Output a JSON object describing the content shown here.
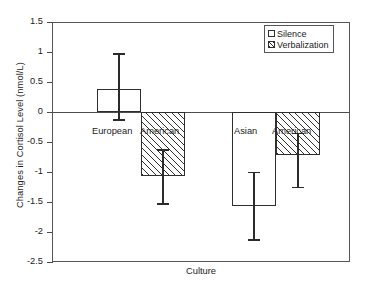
{
  "chart_data": {
    "type": "bar",
    "title": "",
    "xlabel": "Culture",
    "ylabel": "Changes in Cortisol Level  (nmol/L)",
    "categories": [
      "European American",
      "Asian American"
    ],
    "category_lines": [
      [
        "European",
        "American"
      ],
      [
        "Asian",
        "American"
      ]
    ],
    "series": [
      {
        "name": "Silence",
        "fill": "white",
        "values": [
          0.38,
          -1.57
        ],
        "errors_low": [
          -0.12,
          -2.12
        ],
        "errors_high": [
          0.98,
          -1.0
        ]
      },
      {
        "name": "Verbalization",
        "fill": "diagonal-hatch",
        "values": [
          -1.07,
          -0.72
        ],
        "errors_low": [
          -1.52,
          -1.25
        ],
        "errors_high": [
          -0.62,
          -0.35
        ]
      }
    ],
    "ylim": [
      -2.5,
      1.5
    ],
    "ytick_step": 0.5,
    "ytick_labels": [
      "1.5",
      "1",
      "0.5",
      "0",
      "-0.5",
      "-1",
      "-1.5",
      "-2",
      "-2.5"
    ],
    "ytick_values": [
      1.5,
      1,
      0.5,
      0,
      -0.5,
      -1,
      -1.5,
      -2,
      -2.5
    ],
    "grid": false,
    "legend_position": "top-right",
    "legend_entries": [
      "Silence",
      "Verbalization"
    ],
    "colors": {
      "axis": "#555555",
      "bar_outline": "#2e2e2e",
      "bar_fill": "#ffffff",
      "hatch": "#2e2e2e",
      "error_bar": "#2b2b2b",
      "text": "#1b1b1b",
      "background": "#ffffff"
    }
  }
}
